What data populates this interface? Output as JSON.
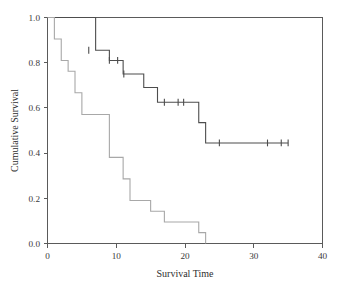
{
  "chart_data": {
    "type": "line",
    "title": "",
    "subtitle": "",
    "xlabel": "Survival Time",
    "ylabel": "Cumulative Survival",
    "xlim": [
      0,
      40
    ],
    "ylim": [
      0.0,
      1.0
    ],
    "xticks": [
      0,
      10,
      20,
      30,
      40
    ],
    "xticklabels": [
      "0",
      "10",
      "20",
      "30",
      "40"
    ],
    "yticks": [
      0.0,
      0.2,
      0.4,
      0.6,
      0.8,
      1.0
    ],
    "yticklabels": [
      "0.0",
      "0.2",
      "0.4",
      "0.6",
      "0.8",
      "1.0"
    ],
    "grid": false,
    "legend_position": "none",
    "step_style": "post",
    "annotations": [
      "Kaplan-Meier step curves with censoring tick marks",
      "Upper curve plateaus at 0.445 after time 23",
      "Lower curve reaches 0.00 at time 23"
    ],
    "series": [
      {
        "name": "Upper survival curve",
        "color": "#4d4d4d",
        "linewidth": 1.1,
        "x": [
          0,
          6,
          7,
          9,
          10,
          11,
          13,
          14,
          16,
          21,
          22,
          23,
          35
        ],
        "y": [
          1.0,
          1.0,
          0.855,
          0.81,
          0.81,
          0.75,
          0.75,
          0.69,
          0.625,
          0.625,
          0.535,
          0.445,
          0.445
        ],
        "censored_x": [
          6,
          9,
          10.2,
          11.1,
          17,
          19,
          19.8,
          25,
          32,
          34,
          35
        ],
        "censored_y": [
          0.855,
          0.81,
          0.81,
          0.75,
          0.625,
          0.625,
          0.625,
          0.445,
          0.445,
          0.445,
          0.445
        ]
      },
      {
        "name": "Lower survival curve",
        "color": "#a8a8a8",
        "linewidth": 1.1,
        "x": [
          0,
          1,
          2,
          3,
          4,
          5,
          8,
          9,
          11,
          12,
          15,
          17,
          20,
          22,
          23
        ],
        "y": [
          1.0,
          0.905,
          0.81,
          0.762,
          0.667,
          0.571,
          0.571,
          0.381,
          0.286,
          0.19,
          0.143,
          0.095,
          0.095,
          0.048,
          0.0
        ],
        "censored_x": [],
        "censored_y": []
      }
    ]
  },
  "axis": {
    "x_title": "Survival Time",
    "y_title": "Cumulative Survival"
  }
}
